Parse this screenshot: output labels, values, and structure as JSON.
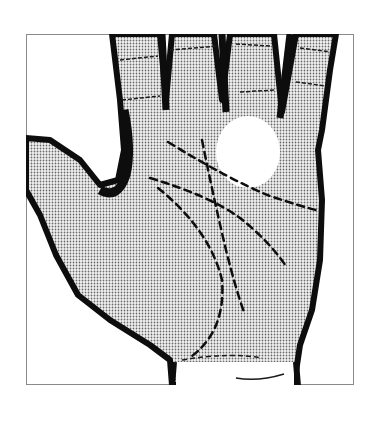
{
  "figure": {
    "style": "halftone-stipple",
    "colors": {
      "background": "#ffffff",
      "frame": "#8a8a8a",
      "ink": "#0d0d0d",
      "palm_fill": "#d9d9d9",
      "highlight": "#ffffff"
    },
    "elements": [
      {
        "name": "hand-outline",
        "description": "Right palm with four fingers extended upward and thumb to the left"
      },
      {
        "name": "highlight-spot",
        "description": "White oval spot below ring finger"
      },
      {
        "name": "heart-line",
        "description": "Dashed line from index finger base curving across to the right edge"
      },
      {
        "name": "head-line",
        "description": "Dashed line from thumb web angling down toward lower right"
      },
      {
        "name": "life-line",
        "description": "Dashed curve arcing around the thumb mound down to the wrist"
      },
      {
        "name": "fate-line",
        "description": "Dashed line rising from the lower palm up toward the middle finger"
      }
    ]
  }
}
